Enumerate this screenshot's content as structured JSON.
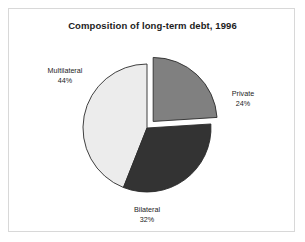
{
  "figure": {
    "title": "Composition of long-term debt, 1996",
    "background_color": "#ffffff",
    "frame_color": "#d8d8d8"
  },
  "labels": {
    "multilateral": {
      "name": "Multilateral",
      "pct": "44%"
    },
    "private": {
      "name": "Private",
      "pct": "24%"
    },
    "bilateral": {
      "name": "Bilateral",
      "pct": "32%"
    }
  },
  "chart_data": {
    "type": "pie",
    "title": "Composition of long-term debt, 1996",
    "xlabel": "",
    "ylabel": "",
    "categories": [
      "Private",
      "Bilateral",
      "Multilateral"
    ],
    "values": [
      24,
      32,
      44
    ],
    "value_unit": "percent",
    "data_labels": [
      "24%",
      "32%",
      "44%"
    ],
    "colors": [
      "#808080",
      "#333333",
      "#ececec"
    ],
    "slice_outline_color": "#2b2b2b",
    "exploded": [
      "Private"
    ],
    "explode_offset_px": 9,
    "start_angle_deg": 0,
    "direction": "clockwise",
    "legend": false,
    "grid": false,
    "series": [
      {
        "name": "Share of long-term debt",
        "values": [
          24,
          32,
          44
        ]
      }
    ]
  }
}
